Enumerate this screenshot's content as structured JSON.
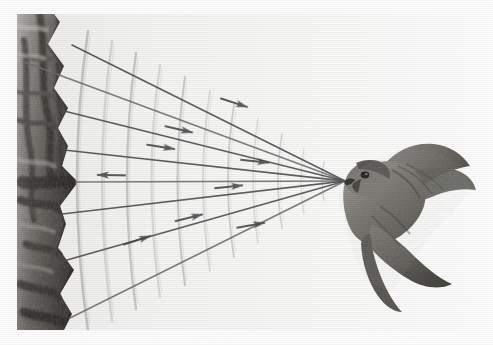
{
  "figure": {
    "title": "Peregrine falcon stooping toward a cliff with radiating ray lines and curved wavefronts",
    "caption": "",
    "width": 493,
    "height": 345,
    "background_color": "#ffffff",
    "paper_tint": "#f7f7f5"
  },
  "palette": {
    "background": "#ffffff",
    "paper": "#f6f6f4",
    "ray_line": "#4a4a4a",
    "ray_line_light": "#6e6e6e",
    "wavefront": "#b9b9b9",
    "wavefront_light": "#cfcfcf",
    "cliff_dark": "#3b3a38",
    "cliff_mid": "#6b6966",
    "cliff_light": "#9b9894",
    "bird_dark": "#5c5a55",
    "bird_mid": "#85837d",
    "bird_light": "#a9a6a0"
  },
  "subjects": {
    "bird": {
      "name": "falcon",
      "label": "Peregrine falcon in flight",
      "position": {
        "x": 398,
        "y": 215
      },
      "beak_tip": {
        "x": 345,
        "y": 181
      },
      "facing": "left"
    },
    "cliff": {
      "name": "rock-cliff",
      "label": "Rock cliff face",
      "region": {
        "x": 17,
        "y": 14,
        "width": 100,
        "height": 316
      },
      "apex": {
        "x": 76,
        "y": 182
      }
    }
  },
  "geometry": {
    "focus": {
      "x": 345,
      "y": 181
    },
    "ray_count": 8,
    "arrow_count": 9,
    "wavefront_count": 11,
    "rays": [
      {
        "id": "ray-1",
        "x": 72,
        "y": 45
      },
      {
        "id": "ray-2",
        "x": 24,
        "y": 62
      },
      {
        "id": "ray-3",
        "x": 60,
        "y": 110
      },
      {
        "id": "ray-4",
        "x": 64,
        "y": 150
      },
      {
        "id": "ray-5",
        "x": 76,
        "y": 182
      },
      {
        "id": "ray-6",
        "x": 62,
        "y": 214
      },
      {
        "id": "ray-7",
        "x": 60,
        "y": 262
      },
      {
        "id": "ray-8",
        "x": 70,
        "y": 318
      }
    ],
    "arrows": [
      {
        "id": "arrow-1",
        "x": 241,
        "y": 105,
        "angle": 18,
        "direction": "right"
      },
      {
        "id": "arrow-2",
        "x": 186,
        "y": 131,
        "angle": 13,
        "direction": "right"
      },
      {
        "id": "arrow-3",
        "x": 104,
        "y": 175,
        "angle": 181,
        "direction": "left"
      },
      {
        "id": "arrow-4",
        "x": 168,
        "y": 148,
        "angle": 9,
        "direction": "right"
      },
      {
        "id": "arrow-5",
        "x": 262,
        "y": 162,
        "angle": 6,
        "direction": "right"
      },
      {
        "id": "arrow-6",
        "x": 236,
        "y": 186,
        "angle": -6,
        "direction": "right"
      },
      {
        "id": "arrow-7",
        "x": 196,
        "y": 216,
        "angle": -14,
        "direction": "right"
      },
      {
        "id": "arrow-8",
        "x": 258,
        "y": 224,
        "angle": -10,
        "direction": "right"
      },
      {
        "id": "arrow-9",
        "x": 144,
        "y": 238,
        "angle": -18,
        "direction": "right"
      }
    ],
    "wavefronts": [
      {
        "id": "wave-1",
        "x": 88,
        "half_height": 150,
        "bulge": 22
      },
      {
        "id": "wave-2",
        "x": 112,
        "half_height": 140,
        "bulge": 20
      },
      {
        "id": "wave-3",
        "x": 136,
        "half_height": 128,
        "bulge": 18
      },
      {
        "id": "wave-4",
        "x": 160,
        "half_height": 116,
        "bulge": 17
      },
      {
        "id": "wave-5",
        "x": 185,
        "half_height": 104,
        "bulge": 15
      },
      {
        "id": "wave-6",
        "x": 210,
        "half_height": 90,
        "bulge": 14
      },
      {
        "id": "wave-7",
        "x": 234,
        "half_height": 76,
        "bulge": 12
      },
      {
        "id": "wave-8",
        "x": 258,
        "half_height": 62,
        "bulge": 10
      },
      {
        "id": "wave-9",
        "x": 282,
        "half_height": 47,
        "bulge": 8
      },
      {
        "id": "wave-10",
        "x": 304,
        "half_height": 33,
        "bulge": 6
      },
      {
        "id": "wave-11",
        "x": 324,
        "half_height": 19,
        "bulge": 4
      }
    ]
  }
}
